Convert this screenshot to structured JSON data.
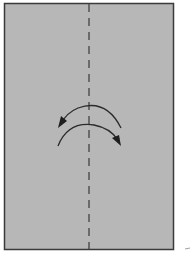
{
  "diagram": {
    "type": "origami-step",
    "paper": {
      "x": 4,
      "y": 3,
      "width": 170,
      "height": 247,
      "fill": "#b7b7b7",
      "stroke": "#3a3a3a"
    },
    "fold_line": {
      "style": "dashed",
      "x": 89,
      "y1": 3,
      "y2": 250,
      "color": "#444444"
    },
    "arrows": [
      {
        "name": "fold-arrow",
        "direction": "right-to-left",
        "color": "#2a2a2a"
      },
      {
        "name": "unfold-arrow",
        "direction": "left-to-right",
        "color": "#2a2a2a"
      }
    ],
    "colors": {
      "background": "#ffffff",
      "paper": "#b7b7b7",
      "line": "#2a2a2a"
    }
  }
}
